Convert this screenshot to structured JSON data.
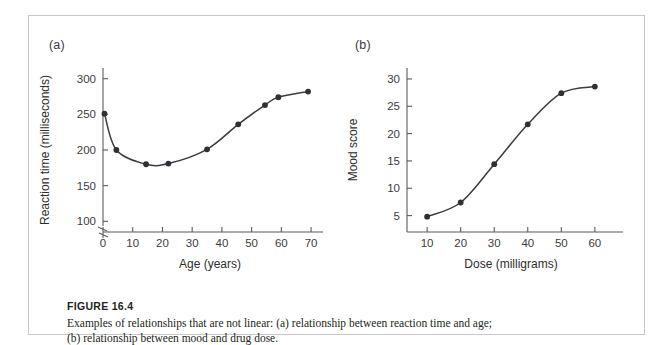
{
  "figure": {
    "number_label": "FIGURE 16.4",
    "caption": "Examples of relationships that are not linear: (a) relationship between reaction time and age; (b) relationship between mood and drug dose."
  },
  "panels": {
    "a": {
      "label": "(a)"
    },
    "b": {
      "label": "(b)"
    }
  },
  "colors": {
    "curve": "#3b3b42",
    "point": "#2f2f36",
    "axis": "#5a5a5a",
    "frame": "#c8c8c8",
    "text": "#231f20"
  },
  "chart_data": [
    {
      "type": "line",
      "panel": "(a)",
      "title": "",
      "xlabel": "Age (years)",
      "ylabel": "Reaction time (milliseconds)",
      "xlim": [
        0,
        72
      ],
      "ylim": [
        85,
        315
      ],
      "y_axis_break": true,
      "grid": false,
      "legend": null,
      "xticks": [
        0,
        10,
        20,
        30,
        40,
        50,
        60,
        70
      ],
      "xticklabels": [
        "0",
        "10",
        "20",
        "30",
        "40",
        "50",
        "60",
        "70"
      ],
      "yticks": [
        100,
        150,
        200,
        250,
        300
      ],
      "yticklabels": [
        "100",
        "150",
        "200",
        "250",
        "300"
      ],
      "x": [
        0.5,
        4.5,
        14.5,
        22,
        35,
        45.5,
        54.5,
        59,
        69
      ],
      "y": [
        251,
        200,
        180,
        181,
        201,
        236,
        263,
        274,
        282
      ]
    },
    {
      "type": "line",
      "panel": "(b)",
      "title": "",
      "xlabel": "Dose (milligrams)",
      "ylabel": "Mood score",
      "xlim": [
        4,
        66
      ],
      "ylim": [
        2,
        32
      ],
      "y_axis_break": false,
      "grid": false,
      "legend": null,
      "xticks": [
        10,
        20,
        30,
        40,
        50,
        60
      ],
      "xticklabels": [
        "10",
        "20",
        "30",
        "40",
        "50",
        "60"
      ],
      "yticks": [
        5,
        10,
        15,
        20,
        25,
        30
      ],
      "yticklabels": [
        "5",
        "10",
        "15",
        "20",
        "25",
        "30"
      ],
      "x": [
        10,
        20,
        30,
        40,
        50,
        60
      ],
      "y": [
        4.8,
        7.4,
        14.4,
        21.7,
        27.4,
        28.6
      ]
    }
  ]
}
